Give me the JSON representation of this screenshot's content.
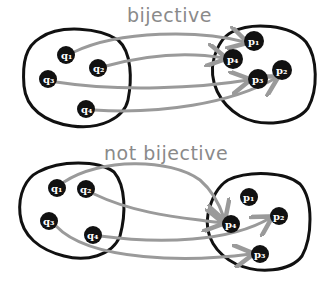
{
  "colors": {
    "set_outline": "#111111",
    "node_fill": "#111111",
    "arrow": "#9a9a9a",
    "label": "#8a8a8a"
  },
  "diagrams": [
    {
      "title": "bijective",
      "domain": [
        {
          "label": "q1",
          "x": 66,
          "y": 55
        },
        {
          "label": "q2",
          "x": 98,
          "y": 68
        },
        {
          "label": "q3",
          "x": 48,
          "y": 79
        },
        {
          "label": "q4",
          "x": 86,
          "y": 109
        }
      ],
      "codomain": [
        {
          "label": "p1",
          "x": 254,
          "y": 41
        },
        {
          "label": "p2",
          "x": 282,
          "y": 70
        },
        {
          "label": "p3",
          "x": 258,
          "y": 79
        },
        {
          "label": "p4",
          "x": 233,
          "y": 59
        }
      ],
      "mappings": [
        {
          "from": "q1",
          "to": "p1"
        },
        {
          "from": "q2",
          "to": "p4"
        },
        {
          "from": "q3",
          "to": "p3"
        },
        {
          "from": "q4",
          "to": "p2"
        }
      ]
    },
    {
      "title": "not bijective",
      "domain": [
        {
          "label": "q1",
          "x": 57,
          "y": 188
        },
        {
          "label": "q2",
          "x": 86,
          "y": 189
        },
        {
          "label": "q3",
          "x": 49,
          "y": 221
        },
        {
          "label": "q4",
          "x": 93,
          "y": 235
        }
      ],
      "codomain": [
        {
          "label": "p1",
          "x": 249,
          "y": 197
        },
        {
          "label": "p2",
          "x": 279,
          "y": 216
        },
        {
          "label": "p3",
          "x": 260,
          "y": 254
        },
        {
          "label": "p4",
          "x": 231,
          "y": 224
        }
      ],
      "mappings": [
        {
          "from": "q1",
          "to": "p4"
        },
        {
          "from": "q2",
          "to": "p4"
        },
        {
          "from": "q3",
          "to": "p3"
        },
        {
          "from": "q4",
          "to": "p2"
        }
      ]
    }
  ]
}
